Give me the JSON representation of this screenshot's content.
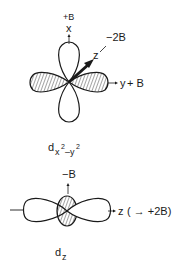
{
  "diagrams": [
    {
      "id": "dx2-y2",
      "caption": {
        "base": "d",
        "sub1": "x",
        "sup1": "2",
        "dash": "–",
        "sub2": "y",
        "sup2": "2"
      },
      "axes": {
        "x": {
          "label": "x",
          "value": "+B"
        },
        "y": {
          "label": "y",
          "value": "+ B"
        },
        "z": {
          "label": "z",
          "value": "−2B"
        }
      }
    },
    {
      "id": "dz2",
      "caption": {
        "base": "d",
        "sub1": "z"
      },
      "axes": {
        "top": {
          "value": "−B"
        },
        "z": {
          "label": "z",
          "value": "( → +2B)"
        }
      }
    }
  ],
  "colors": {
    "ink": "#1a1a1a",
    "paper": "#ffffff"
  }
}
